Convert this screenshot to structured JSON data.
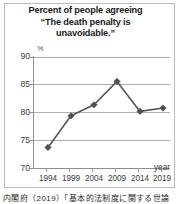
{
  "chart_data": {
    "type": "line",
    "title": "Percent of people agreeing “The death penalty is unavoidable.”",
    "title_lines": [
      "Percent of people agreeing",
      "“The death penalty is",
      "unavoidable.”"
    ],
    "xlabel": "year",
    "ylabel": "%",
    "categories": [
      "1994",
      "1999",
      "2004",
      "2009",
      "2014",
      "2019"
    ],
    "x": [
      1994,
      1999,
      2004,
      2009,
      2014,
      2019
    ],
    "values": [
      73.7,
      79.4,
      81.4,
      85.6,
      80.2,
      80.8
    ],
    "series": [
      {
        "name": "Percent agreeing",
        "values": [
          73.7,
          79.4,
          81.4,
          85.6,
          80.2,
          80.8
        ]
      }
    ],
    "ylim": [
      70,
      90
    ],
    "yticks": [
      90,
      85,
      80,
      75,
      70
    ],
    "xticks": [
      "1994",
      "1999",
      "2004",
      "2009",
      "2014",
      "2019"
    ],
    "grid": true,
    "legend": false,
    "marker": "diamond",
    "line_color": "#565656",
    "marker_color": "#4f4f4f",
    "grid_color": "#aeaeae",
    "axis_color": "#8e8e8e"
  },
  "caption": {
    "text": "内閣府（2019）「基本的法制度に関する世論"
  }
}
